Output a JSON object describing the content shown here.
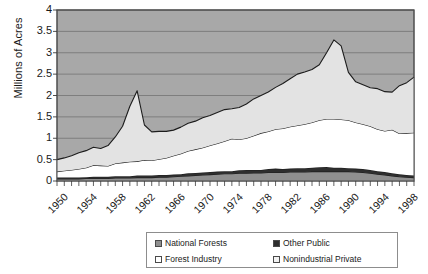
{
  "chart_data": {
    "type": "area",
    "stacked": true,
    "title": "",
    "xlabel": "",
    "ylabel": "Millions of Acres",
    "ylim": [
      0,
      4
    ],
    "yticks": [
      "0",
      "0.5",
      "1",
      "1.5",
      "2",
      "2.5",
      "3",
      "3.5",
      "4"
    ],
    "ytick_values": [
      0,
      0.5,
      1,
      1.5,
      2,
      2.5,
      3,
      3.5,
      4
    ],
    "xlim": [
      1950,
      1999
    ],
    "xtick_labels": [
      "1950",
      "1954",
      "1958",
      "1962",
      "1966",
      "1970",
      "1974",
      "1978",
      "1982",
      "1986",
      "1990",
      "1994",
      "1998"
    ],
    "xtick_values": [
      1950,
      1954,
      1958,
      1962,
      1966,
      1970,
      1974,
      1978,
      1982,
      1986,
      1990,
      1994,
      1998
    ],
    "grid": true,
    "grid_axis": "y",
    "legend_position": "bottom",
    "plot_background": "#a8a8a8",
    "x": [
      1950,
      1951,
      1952,
      1953,
      1954,
      1955,
      1956,
      1957,
      1958,
      1959,
      1960,
      1961,
      1962,
      1963,
      1964,
      1965,
      1966,
      1967,
      1968,
      1969,
      1970,
      1971,
      1972,
      1973,
      1974,
      1975,
      1976,
      1977,
      1978,
      1979,
      1980,
      1981,
      1982,
      1983,
      1984,
      1985,
      1986,
      1987,
      1988,
      1989,
      1990,
      1991,
      1992,
      1993,
      1994,
      1995,
      1996,
      1997,
      1998,
      1999
    ],
    "series": [
      {
        "name": "National Forests",
        "color": "#8f8f8f",
        "swatch": "checkered-gray",
        "values": [
          0.05,
          0.05,
          0.05,
          0.05,
          0.06,
          0.06,
          0.06,
          0.06,
          0.07,
          0.07,
          0.07,
          0.08,
          0.08,
          0.08,
          0.09,
          0.09,
          0.1,
          0.11,
          0.12,
          0.13,
          0.14,
          0.15,
          0.16,
          0.17,
          0.17,
          0.18,
          0.18,
          0.19,
          0.19,
          0.2,
          0.2,
          0.2,
          0.21,
          0.21,
          0.21,
          0.22,
          0.22,
          0.22,
          0.22,
          0.22,
          0.22,
          0.21,
          0.2,
          0.18,
          0.16,
          0.14,
          0.12,
          0.1,
          0.09,
          0.08
        ]
      },
      {
        "name": "Other Public",
        "color": "#2e2e2e",
        "swatch": "solid-dark",
        "values": [
          0.03,
          0.03,
          0.03,
          0.03,
          0.03,
          0.04,
          0.04,
          0.04,
          0.04,
          0.04,
          0.04,
          0.05,
          0.05,
          0.05,
          0.05,
          0.05,
          0.05,
          0.05,
          0.06,
          0.06,
          0.06,
          0.06,
          0.06,
          0.06,
          0.06,
          0.07,
          0.08,
          0.07,
          0.07,
          0.08,
          0.09,
          0.08,
          0.08,
          0.09,
          0.09,
          0.09,
          0.1,
          0.11,
          0.09,
          0.09,
          0.08,
          0.08,
          0.08,
          0.08,
          0.07,
          0.07,
          0.06,
          0.06,
          0.05,
          0.05
        ]
      },
      {
        "name": "Forest Industry",
        "color": "#ffffff",
        "swatch": "white",
        "values": [
          0.14,
          0.16,
          0.18,
          0.2,
          0.22,
          0.27,
          0.26,
          0.25,
          0.3,
          0.32,
          0.34,
          0.33,
          0.36,
          0.35,
          0.37,
          0.4,
          0.44,
          0.48,
          0.52,
          0.55,
          0.58,
          0.62,
          0.66,
          0.7,
          0.76,
          0.72,
          0.74,
          0.8,
          0.86,
          0.88,
          0.92,
          0.95,
          0.98,
          1.0,
          1.03,
          1.06,
          1.1,
          1.12,
          1.14,
          1.13,
          1.12,
          1.08,
          1.05,
          1.02,
          0.98,
          0.96,
          1.02,
          0.95,
          0.98,
          1.0
        ]
      },
      {
        "name": "Nonindustrial Private",
        "color": "#e3e3e3",
        "swatch": "light-gray",
        "values": [
          0.28,
          0.3,
          0.33,
          0.38,
          0.4,
          0.42,
          0.4,
          0.48,
          0.62,
          0.85,
          1.3,
          1.65,
          0.82,
          0.67,
          0.65,
          0.62,
          0.6,
          0.62,
          0.65,
          0.66,
          0.7,
          0.7,
          0.72,
          0.74,
          0.7,
          0.75,
          0.8,
          0.86,
          0.88,
          0.92,
          0.98,
          1.05,
          1.12,
          1.2,
          1.22,
          1.24,
          1.3,
          1.55,
          1.85,
          1.72,
          1.12,
          0.95,
          0.92,
          0.9,
          0.95,
          0.92,
          0.88,
          1.12,
          1.18,
          1.3
        ]
      }
    ]
  },
  "legend": {
    "entries": [
      {
        "label": "National Forests"
      },
      {
        "label": "Other Public"
      },
      {
        "label": "Forest Industry"
      },
      {
        "label": "Nonindustrial Private"
      }
    ]
  }
}
